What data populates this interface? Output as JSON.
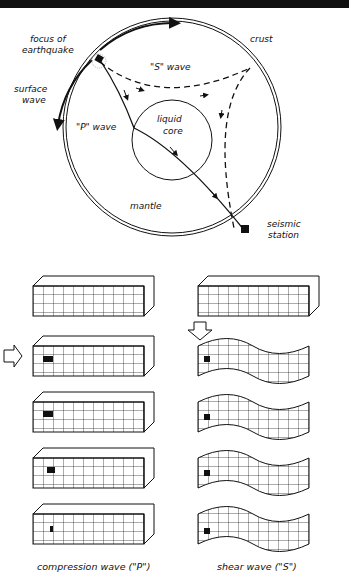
{
  "diagram": {
    "earth_labels": {
      "focus": [
        "focus of",
        "earthquake"
      ],
      "crust": "crust",
      "s_wave": "\"S\" wave",
      "surface_wave": [
        "surface",
        "wave"
      ],
      "p_wave": "\"P\" wave",
      "core": [
        "liquid",
        "core"
      ],
      "mantle": "mantle",
      "station": [
        "seismic",
        "station"
      ]
    },
    "captions": {
      "compression": "compression wave (\"P\")",
      "shear": "shear wave (\"S\")"
    },
    "colors": {
      "ink": "#111111",
      "background": "#ffffff"
    }
  }
}
